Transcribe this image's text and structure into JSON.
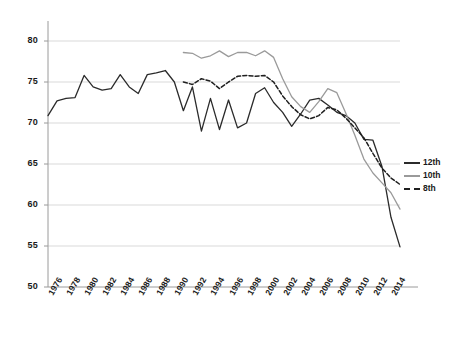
{
  "chart_data": {
    "type": "line",
    "title": "",
    "subtitle": "",
    "xlabel": "",
    "ylabel": "",
    "xlim": [
      1976,
      2015
    ],
    "ylim": [
      50,
      80
    ],
    "yticks": [
      50,
      55,
      60,
      65,
      70,
      75,
      80
    ],
    "xticks": [
      1976,
      1978,
      1980,
      1982,
      1984,
      1986,
      1988,
      1990,
      1992,
      1994,
      1996,
      1998,
      2000,
      2002,
      2004,
      2006,
      2008,
      2010,
      2012,
      2014
    ],
    "grid": true,
    "legend_position": "right",
    "series": [
      {
        "name": "12th",
        "color": "#2b2b2b",
        "style": "solid",
        "x": [
          1976,
          1977,
          1978,
          1979,
          1980,
          1981,
          1982,
          1983,
          1984,
          1985,
          1986,
          1987,
          1988,
          1989,
          1990,
          1991,
          1992,
          1993,
          1994,
          1995,
          1996,
          1997,
          1998,
          1999,
          2000,
          2001,
          2002,
          2003,
          2004,
          2005,
          2006,
          2007,
          2008,
          2009,
          2010,
          2011,
          2012,
          2013,
          2014,
          2015
        ],
        "y": [
          70.9,
          72.7,
          73.0,
          73.1,
          75.8,
          74.4,
          74.0,
          74.2,
          75.9,
          74.4,
          73.6,
          75.9,
          76.1,
          76.4,
          75.0,
          71.5,
          74.4,
          69.0,
          73.0,
          69.2,
          72.8,
          69.4,
          70.0,
          73.6,
          74.3,
          72.5,
          71.3,
          69.6,
          71.1,
          72.8,
          73.0,
          72.2,
          71.3,
          70.9,
          70.0,
          68.0,
          67.9,
          64.7,
          58.5,
          54.9
        ]
      },
      {
        "name": "10th",
        "color": "#9a9a9a",
        "style": "solid",
        "x": [
          1991,
          1992,
          1993,
          1994,
          1995,
          1996,
          1997,
          1998,
          1999,
          2000,
          2001,
          2002,
          2003,
          2004,
          2005,
          2006,
          2007,
          2008,
          2009,
          2010,
          2011,
          2012,
          2013,
          2014,
          2015
        ],
        "y": [
          78.6,
          78.5,
          77.9,
          78.2,
          78.8,
          78.1,
          78.6,
          78.6,
          78.2,
          78.8,
          78.0,
          75.4,
          73.2,
          72.0,
          71.3,
          72.6,
          74.2,
          73.7,
          71.2,
          68.5,
          65.6,
          63.9,
          62.7,
          61.5,
          59.5
        ]
      },
      {
        "name": "8th",
        "color": "#1f1f1f",
        "style": "dashed",
        "x": [
          1991,
          1992,
          1993,
          1994,
          1995,
          1996,
          1997,
          1998,
          1999,
          2000,
          2001,
          2002,
          2003,
          2004,
          2005,
          2006,
          2007,
          2008,
          2009,
          2010,
          2011,
          2012,
          2013,
          2014,
          2015
        ],
        "y": [
          75.0,
          74.7,
          75.4,
          75.1,
          74.2,
          75.0,
          75.7,
          75.8,
          75.7,
          75.8,
          75.0,
          73.3,
          72.0,
          71.0,
          70.5,
          70.9,
          71.9,
          71.6,
          70.6,
          69.4,
          68.2,
          66.3,
          64.5,
          63.3,
          62.5
        ]
      }
    ]
  },
  "axes": {
    "y_tick_labels": [
      "80",
      "75",
      "70",
      "65",
      "60",
      "55",
      "50"
    ],
    "x_tick_labels": [
      "1976",
      "1978",
      "1980",
      "1982",
      "1984",
      "1986",
      "1988",
      "1990",
      "1992",
      "1994",
      "1996",
      "1998",
      "2000",
      "2002",
      "2004",
      "2006",
      "2008",
      "2010",
      "2012",
      "2014"
    ]
  },
  "legend": {
    "items": [
      {
        "label": "12th",
        "color": "#2b2b2b",
        "style": "solid"
      },
      {
        "label": "10th",
        "color": "#9a9a9a",
        "style": "solid"
      },
      {
        "label": "8th",
        "color": "#1f1f1f",
        "style": "dashed"
      }
    ]
  },
  "colors": {
    "grade12": "#2b2b2b",
    "grade10": "#9a9a9a",
    "grade8": "#1f1f1f",
    "grid": "#d9d9d9",
    "axis": "#9a9a9a",
    "text": "#1a1a1a",
    "background": "#ffffff"
  }
}
